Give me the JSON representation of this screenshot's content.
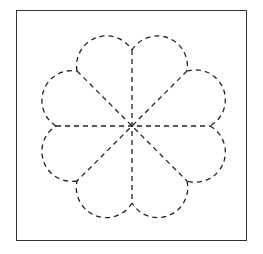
{
  "diagram": {
    "type": "dashed-flower-figure",
    "petals": 8,
    "center": [
      132,
      126
    ],
    "stroke_color": "#222222",
    "frame_color": "#333333"
  }
}
